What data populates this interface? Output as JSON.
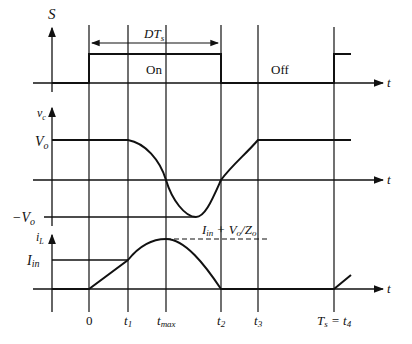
{
  "figure": {
    "type": "timing-diagram",
    "colors": {
      "stroke": "#111111",
      "background": "#ffffff"
    },
    "switch_signal": {
      "axis_label": "S",
      "duty_label": "DT",
      "duty_sub": "s",
      "on_label": "On",
      "off_label": "Off",
      "time_label": "t"
    },
    "capacitor_voltage": {
      "axis_label": "v",
      "axis_sub": "c",
      "pos_level": "V",
      "pos_sub": "o",
      "neg_level_prefix": "−V",
      "neg_sub": "o",
      "time_label": "t"
    },
    "inductor_current": {
      "axis_label": "i",
      "axis_sub": "L",
      "level_label": "I",
      "level_sub": "in",
      "peak_label_I": "I",
      "peak_label_in": "in",
      "peak_label_rest": " + V",
      "peak_label_o1": "o",
      "peak_label_Z": "/Z",
      "peak_label_o2": "o",
      "time_label": "t"
    },
    "time_ticks": {
      "t0": "0",
      "t1": "t",
      "t1_sub": "1",
      "tmax": "t",
      "tmax_sub": "max",
      "t2": "t",
      "t2_sub": "2",
      "t3": "t",
      "t3_sub": "3",
      "ts": "T",
      "ts_sub": "s",
      "ts_eq": " = t",
      "t4_sub": "4"
    }
  }
}
